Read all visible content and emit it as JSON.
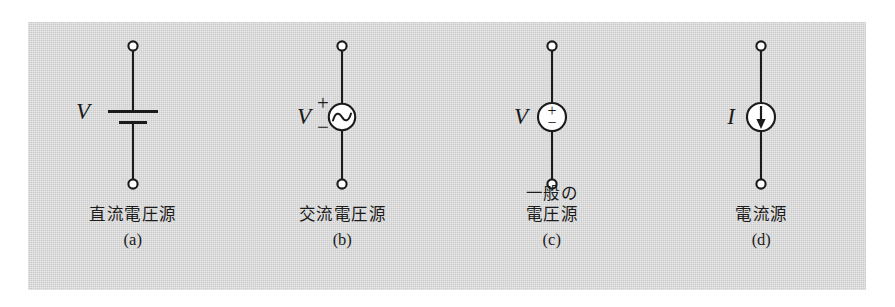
{
  "figure": {
    "background_color": "#ffffff",
    "plate_color": "#d2d2d2",
    "ink_color": "#1b1b1b",
    "panels": [
      {
        "index_label": "(a)",
        "caption_lines": [
          "直流電圧源"
        ],
        "symbol_name": "dc-voltage-source",
        "quantity_label": "V",
        "polarity_marks": [],
        "terminals": 2
      },
      {
        "index_label": "(b)",
        "caption_lines": [
          "交流電圧源"
        ],
        "symbol_name": "ac-voltage-source",
        "quantity_label": "V",
        "polarity_marks": [
          "+",
          "−"
        ],
        "terminals": 2
      },
      {
        "index_label": "(c)",
        "caption_lines": [
          "一般の",
          "電圧源"
        ],
        "symbol_name": "generic-voltage-source",
        "quantity_label": "V",
        "polarity_marks": [
          "+",
          "−"
        ],
        "terminals": 2
      },
      {
        "index_label": "(d)",
        "caption_lines": [
          "電流源"
        ],
        "symbol_name": "current-source",
        "quantity_label": "I",
        "polarity_marks": [],
        "terminals": 2
      }
    ]
  }
}
